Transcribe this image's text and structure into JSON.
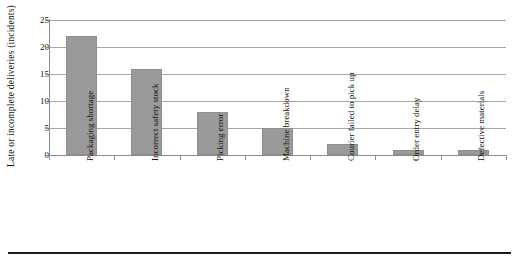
{
  "chart_data": {
    "type": "bar",
    "title": "",
    "xlabel": "",
    "ylabel": "Late or incomplete deliveries (incidents)",
    "categories": [
      "Packaging shortage",
      "Incorrect safety stock",
      "Picking error",
      "Machine breakdown",
      "Courier failed to pick up",
      "Order entry delay",
      "Defective materials"
    ],
    "values": [
      22,
      16,
      8,
      5,
      2,
      1,
      1
    ],
    "ylim": [
      0,
      25
    ],
    "yticks": [
      "0",
      "5",
      "10",
      "15",
      "20",
      "25"
    ],
    "ytick_values": [
      0,
      5,
      10,
      15,
      20,
      25
    ],
    "grid": "horizontal",
    "legend": "none",
    "bar_color": "#9a9a9a",
    "bar_border_color": "#8e8e8e",
    "gridline_color": "#a8a8a8",
    "axis_color": "#8c8c8c",
    "text_color": "#111111",
    "background": "#ffffff"
  }
}
